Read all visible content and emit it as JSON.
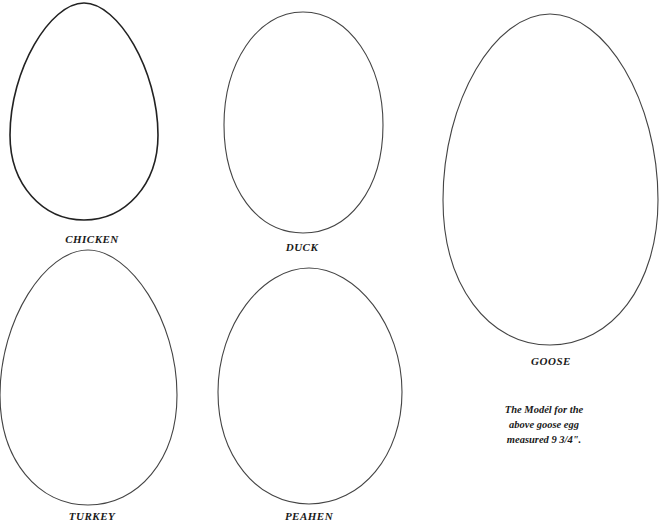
{
  "eggs": [
    {
      "name": "chicken",
      "label": "CHICKEN",
      "cx": 84,
      "top": 3,
      "bottom": 220,
      "halfwidth": 74,
      "stroke": "#222222",
      "stroke_width": 1.6,
      "label_x": 92,
      "label_y": 233
    },
    {
      "name": "duck",
      "label": "DUCK",
      "cx": 303,
      "top": 12,
      "bottom": 233,
      "halfwidth": 80,
      "stroke": "#444444",
      "stroke_width": 1.1,
      "label_x": 302,
      "label_y": 241
    },
    {
      "name": "goose",
      "label": "GOOSE",
      "cx": 551,
      "top": 14,
      "bottom": 345,
      "halfwidth": 107,
      "stroke": "#444444",
      "stroke_width": 1.1,
      "label_x": 551,
      "label_y": 355
    },
    {
      "name": "turkey",
      "label": "TURKEY",
      "cx": 88,
      "top": 250,
      "bottom": 505,
      "halfwidth": 88,
      "stroke": "#444444",
      "stroke_width": 1.1,
      "label_x": 92,
      "label_y": 510
    },
    {
      "name": "peahen",
      "label": "PEAHEN",
      "cx": 309,
      "top": 268,
      "bottom": 504,
      "halfwidth": 92,
      "stroke": "#444444",
      "stroke_width": 1.1,
      "label_x": 309,
      "label_y": 510
    }
  ],
  "note": {
    "lines": [
      "The Modél for the",
      "above goose egg",
      "measured 9 3/4\"."
    ]
  }
}
